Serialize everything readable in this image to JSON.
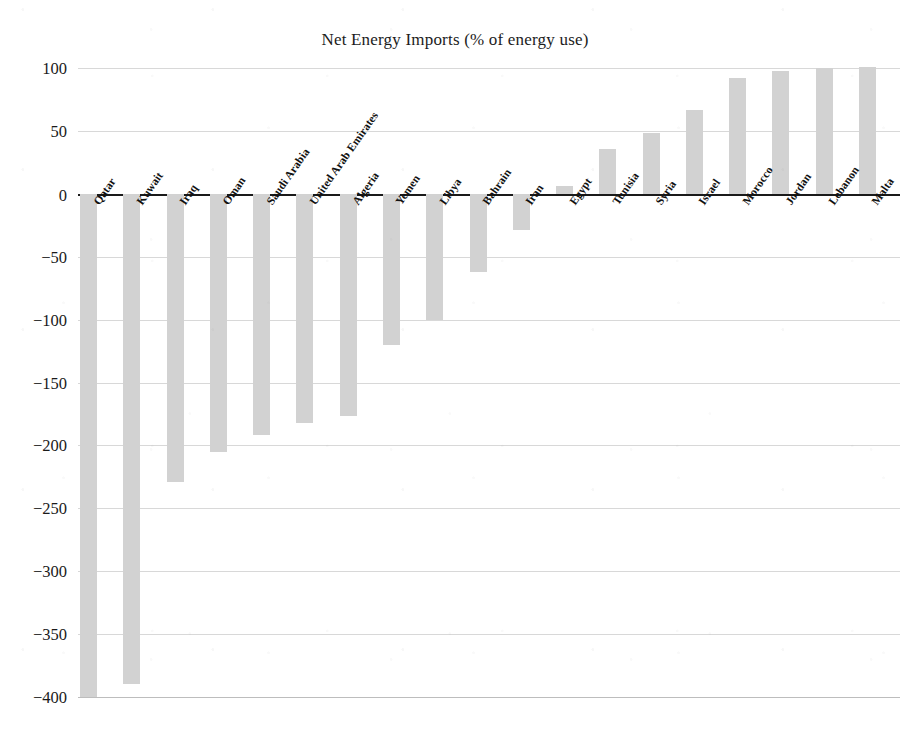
{
  "chart_data": {
    "type": "bar",
    "title": "Net Energy Imports (% of energy use)",
    "xlabel": "",
    "ylabel": "",
    "ylim": [
      -400,
      100
    ],
    "ytick_step": 50,
    "grid": true,
    "legend": "none",
    "bar_color": "#d2d2d2",
    "yticks": [
      100,
      50,
      0,
      -50,
      -100,
      -150,
      -200,
      -250,
      -300,
      -350,
      -400
    ],
    "ytick_labels": [
      "100",
      "50",
      "0",
      "−50",
      "−100",
      "−150",
      "−200",
      "−250",
      "−300",
      "−350",
      "−400"
    ],
    "categories": [
      "Qatar",
      "Kuwait",
      "Iraq",
      "Oman",
      "Saudi Arabia",
      "United Arab Emirates",
      "Algeria",
      "Yemen",
      "Libya",
      "Bahrain",
      "Iran",
      "Egypt",
      "Tunisia",
      "Syria",
      "Israel",
      "Morocco",
      "Jordan",
      "Lebanon",
      "Malta"
    ],
    "values": [
      -400,
      -390,
      -229,
      -205,
      -192,
      -182,
      -177,
      -120,
      -100,
      -62,
      -29,
      6,
      36,
      48,
      67,
      92,
      98,
      100,
      101
    ]
  }
}
